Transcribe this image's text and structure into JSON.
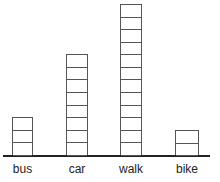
{
  "chart_data": {
    "type": "bar",
    "style": "stacked unit blocks (pictograph-style)",
    "title": "",
    "xlabel": "",
    "ylabel": "",
    "categories": [
      "bus",
      "car",
      "walk",
      "bike"
    ],
    "values": [
      3,
      8,
      12,
      2
    ],
    "grid": false,
    "legend": null,
    "colors": {
      "bar_fill": "#ffffff",
      "bar_stroke": "#555555",
      "axis": "#222222"
    }
  }
}
